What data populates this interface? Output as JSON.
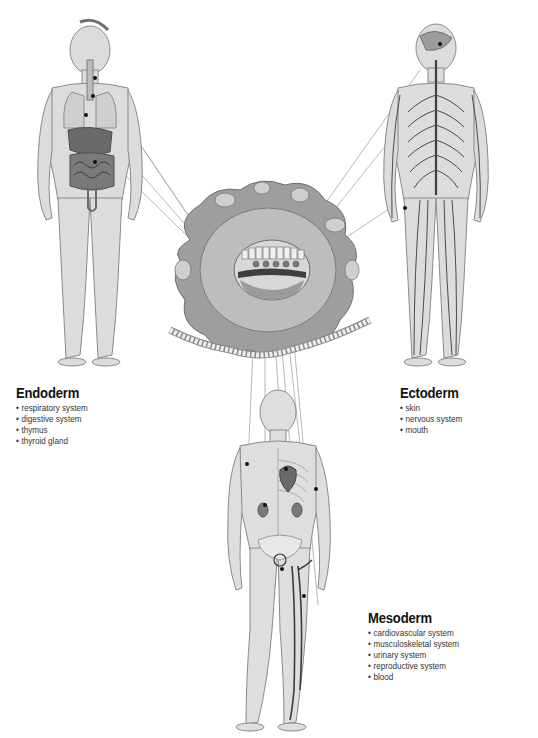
{
  "diagram": {
    "colors": {
      "background": "#ffffff",
      "body_fill": "#d9d9d9",
      "body_outline": "#8a8a8a",
      "organ_dark": "#5e5e5e",
      "nerve": "#4a4a4a",
      "embryo_outer": "#9a9a9a",
      "embryo_inner": "#bcbcbc",
      "leader_line": "#9e9e9e",
      "vessel": "#3b3b3b"
    },
    "center": {
      "label": "embryo-cross-section",
      "icon": "embryo-icon"
    },
    "layers": [
      {
        "name": "Endoderm",
        "figure": "human-figure-digestive-respiratory",
        "items": [
          "respiratory system",
          "digestive system",
          "thymus",
          "thyroid gland"
        ]
      },
      {
        "name": "Ectoderm",
        "figure": "human-figure-nervous-system",
        "items": [
          "skin",
          "nervous system",
          "mouth"
        ]
      },
      {
        "name": "Mesoderm",
        "figure": "human-figure-skeletal-circulatory",
        "items": [
          "cardiovascular system",
          "musculoskeletal system",
          "urinary system",
          "reproductive system",
          "blood"
        ]
      }
    ]
  }
}
